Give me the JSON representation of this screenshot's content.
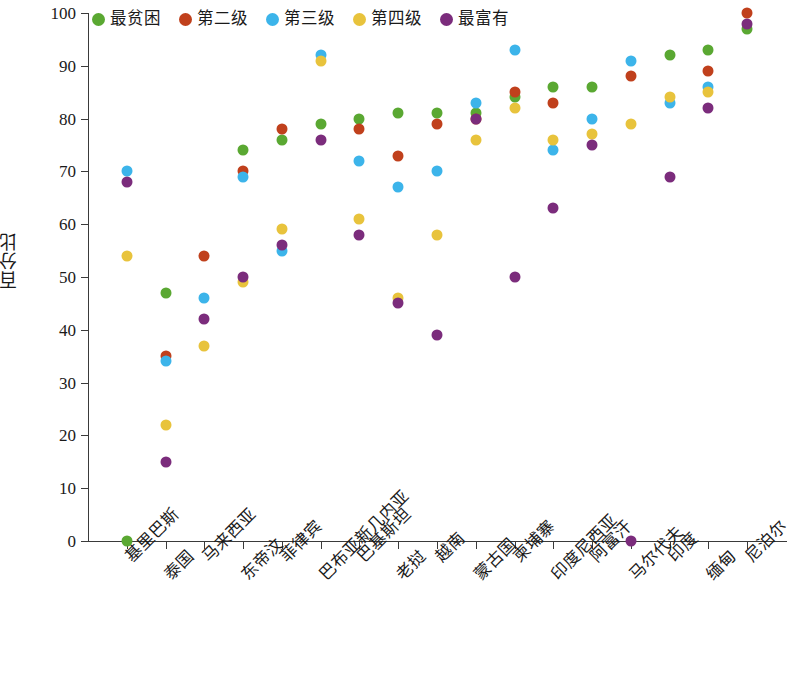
{
  "chart_data": {
    "type": "scatter",
    "title": "",
    "xlabel": "",
    "ylabel": "百分比",
    "ylim": [
      0,
      100
    ],
    "ytick_values": [
      0,
      10,
      20,
      30,
      40,
      50,
      60,
      70,
      80,
      90,
      100
    ],
    "ytick_labels": [
      "0",
      "10",
      "20",
      "30",
      "40",
      "50",
      "60",
      "70",
      "80",
      "90",
      "100"
    ],
    "grid": false,
    "legend_position": "top-left",
    "marker": "circle",
    "categories": [
      "基里巴斯",
      "泰国",
      "马来西亚",
      "东帝汶",
      "菲律宾",
      "巴布亚新几内亚",
      "巴基斯坦",
      "老挝",
      "越南",
      "蒙古国",
      "柬埔寨",
      "印度尼西亚",
      "阿富汗",
      "马尔代夫",
      "印度",
      "缅甸",
      "尼泊尔"
    ],
    "series": [
      {
        "name": "最贫困",
        "color": "#5aa832",
        "values": [
          0,
          47,
          null,
          74,
          76,
          79,
          80,
          81,
          81,
          81,
          84,
          86,
          86,
          null,
          92,
          93,
          97
        ]
      },
      {
        "name": "第二级",
        "color": "#c0401c",
        "values": [
          null,
          35,
          54,
          70,
          78,
          null,
          78,
          73,
          79,
          80,
          85,
          83,
          null,
          88,
          null,
          89,
          100
        ]
      },
      {
        "name": "第三级",
        "color": "#3cb4ea",
        "values": [
          70,
          34,
          46,
          69,
          55,
          92,
          72,
          67,
          70,
          83,
          93,
          74,
          80,
          91,
          83,
          86,
          null
        ]
      },
      {
        "name": "第四级",
        "color": "#e8c33c",
        "values": [
          54,
          22,
          37,
          49,
          59,
          91,
          61,
          46,
          58,
          76,
          82,
          76,
          77,
          79,
          84,
          85,
          null
        ]
      },
      {
        "name": "最富有",
        "color": "#7b2c7c",
        "values": [
          68,
          15,
          42,
          50,
          56,
          76,
          58,
          45,
          39,
          80,
          50,
          63,
          75,
          0,
          69,
          82,
          98
        ]
      }
    ]
  }
}
